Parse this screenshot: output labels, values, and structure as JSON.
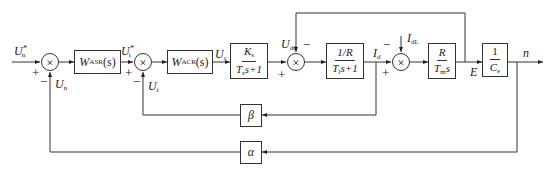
{
  "diagram": {
    "type": "block-diagram",
    "signals": {
      "speed_ref": {
        "main": "U",
        "sub": "n",
        "sup": "*"
      },
      "speed_fb": {
        "main": "U",
        "sub": "n"
      },
      "current_ref": {
        "main": "U",
        "sub": "i",
        "sup": "*"
      },
      "current_fb": {
        "main": "U",
        "sub": "i"
      },
      "control_voltage": {
        "main": "U",
        "sub": "c"
      },
      "rectifier_voltage": {
        "main": "U",
        "sub": "d0"
      },
      "armature_current": {
        "main": "I",
        "sub": "d"
      },
      "load_current": {
        "main": "I",
        "sub": "dL"
      },
      "back_emf": {
        "main": "E"
      },
      "speed_out": {
        "main": "n"
      }
    },
    "blocks": {
      "asr": {
        "main": "W",
        "sub": "ASR",
        "tail": "(s)"
      },
      "acr": {
        "main": "W",
        "sub": "ACR",
        "tail": "(s)"
      },
      "converter": {
        "num_main": "K",
        "num_sub": "s",
        "den_main": "T",
        "den_sub": "s",
        "den_tail": "s+1"
      },
      "armature": {
        "num": "1/R",
        "den_main": "T",
        "den_sub": "l",
        "den_tail": "s+1"
      },
      "mechanical": {
        "num": "R",
        "den_main": "T",
        "den_sub": "m",
        "den_tail": "s"
      },
      "emf": {
        "num": "1",
        "den_main": "C",
        "den_sub": "e"
      },
      "current_feedback": {
        "label": "β"
      },
      "speed_feedback": {
        "label": "α"
      }
    },
    "summing_junctions": {
      "sum1": {
        "symbol": "×",
        "plus": "+",
        "minus": "−"
      },
      "sum2": {
        "symbol": "×",
        "plus": "+",
        "minus": "−"
      },
      "sum3": {
        "symbol": "×",
        "plus": "+",
        "minus": "−"
      },
      "sum4": {
        "symbol": "×",
        "plus": "+",
        "minus": "−"
      }
    }
  }
}
